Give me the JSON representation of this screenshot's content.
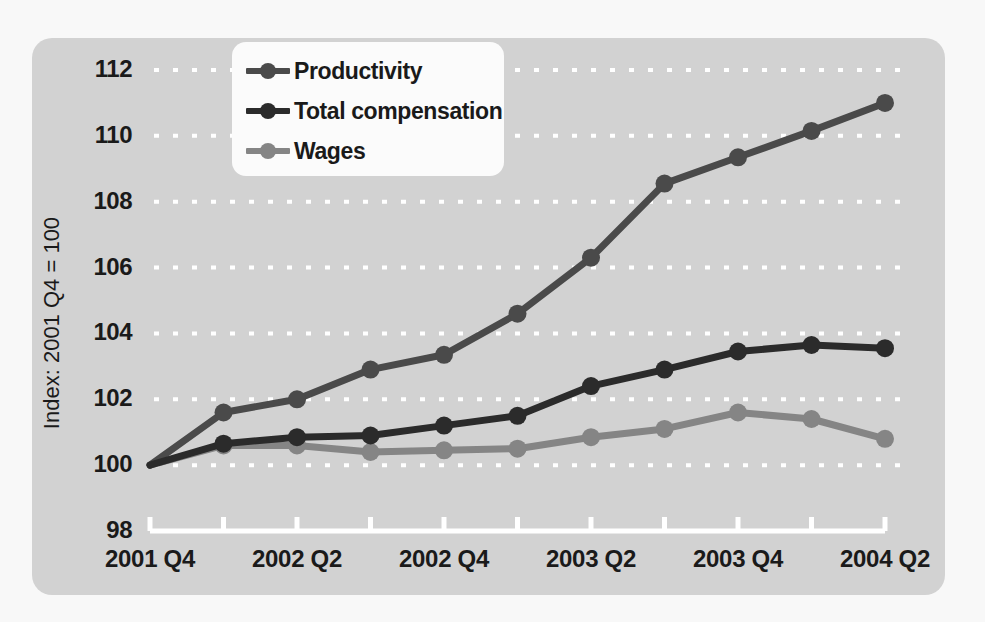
{
  "chart_data": {
    "type": "line",
    "title": "",
    "subtitle": "",
    "xlabel": "",
    "ylabel": "Index: 2001 Q4 = 100",
    "grid": true,
    "legend_position": "top-left",
    "ylim": [
      98,
      113
    ],
    "yticks": [
      98,
      100,
      102,
      104,
      106,
      108,
      110,
      112
    ],
    "x": [
      "2001 Q4",
      "2002 Q1",
      "2002 Q2",
      "2002 Q3",
      "2002 Q4",
      "2003 Q1",
      "2003 Q2",
      "2003 Q3",
      "2003 Q4",
      "2004 Q1",
      "2004 Q2"
    ],
    "xtick_labels": [
      "2001 Q4",
      "",
      "2002 Q2",
      "",
      "2002 Q4",
      "",
      "2003 Q2",
      "",
      "2003 Q4",
      "",
      "2004 Q2"
    ],
    "series": [
      {
        "name": "Productivity",
        "color": "#4a4a4a",
        "values": [
          100.0,
          101.6,
          102.0,
          102.9,
          103.35,
          104.6,
          106.3,
          108.55,
          109.35,
          110.15,
          111.0
        ]
      },
      {
        "name": "Total compensation",
        "color": "#2b2b2b",
        "values": [
          100.0,
          100.65,
          100.85,
          100.9,
          101.2,
          101.5,
          102.4,
          102.9,
          103.45,
          103.65,
          103.55
        ]
      },
      {
        "name": "Wages",
        "color": "#858585",
        "values": [
          100.0,
          100.6,
          100.6,
          100.4,
          100.45,
          100.5,
          100.85,
          101.1,
          101.6,
          101.4,
          100.8
        ]
      }
    ]
  },
  "figure": {
    "card_color": "#d2d2d2",
    "page_background": "#f8f8f8",
    "axis_color": "#ffffff",
    "grid_color": "#ffffff",
    "text_color": "#1a1a1a",
    "legend_background": "#fbfbfb"
  },
  "legend": {
    "items": [
      {
        "label": "Productivity",
        "color": "#4a4a4a"
      },
      {
        "label": "Total compensation",
        "color": "#2b2b2b"
      },
      {
        "label": "Wages",
        "color": "#858585"
      }
    ]
  }
}
